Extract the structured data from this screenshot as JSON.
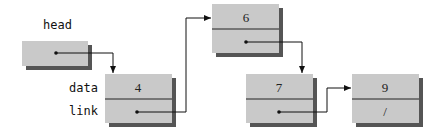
{
  "diagram": {
    "type": "linked-list",
    "colors": {
      "node_fill": "#c9c9c9",
      "shadow": "#555555",
      "line": "#111111",
      "background": "#ffffff"
    },
    "labels": {
      "head": "head",
      "data": "data",
      "link": "link"
    },
    "nodes": [
      {
        "id": "n4",
        "data": "4",
        "link": "next"
      },
      {
        "id": "n6",
        "data": "6",
        "link": "next"
      },
      {
        "id": "n7",
        "data": "7",
        "link": "next"
      },
      {
        "id": "n9",
        "data": "9",
        "link": "/"
      }
    ]
  }
}
